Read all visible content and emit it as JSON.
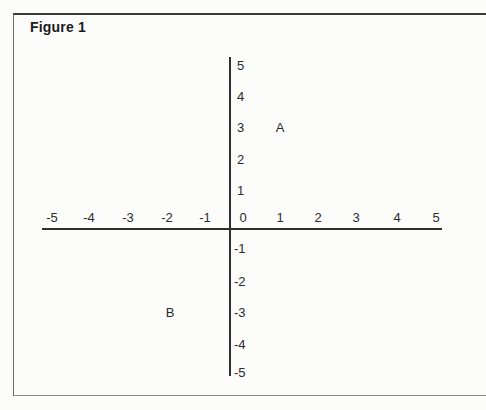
{
  "chart_data": {
    "type": "scatter",
    "title": "Figure 1",
    "xlabel": "",
    "ylabel": "",
    "xlim": [
      -5,
      5
    ],
    "ylim": [
      -5,
      5
    ],
    "grid": false,
    "legend": false,
    "x_tick_labels": [
      "-5",
      "-4",
      "-3",
      "-2",
      "-1",
      "0",
      "1",
      "2",
      "3",
      "4",
      "5"
    ],
    "y_tick_labels": [
      "5",
      "4",
      "3",
      "2",
      "1",
      "-1",
      "-2",
      "-3",
      "-4",
      "-5"
    ],
    "points": [
      {
        "label": "A",
        "x": 1,
        "y": 3
      },
      {
        "label": "B",
        "x": -2,
        "y": -3
      }
    ]
  }
}
